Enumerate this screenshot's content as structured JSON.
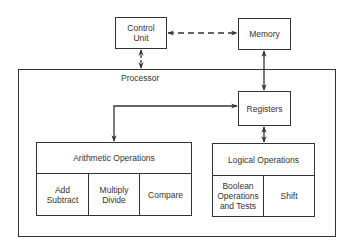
{
  "diagram": {
    "control_unit": {
      "label": "Control\nUnit",
      "line1": "Control",
      "line2": "Unit"
    },
    "memory": {
      "label": "Memory"
    },
    "processor": {
      "label": "Processor"
    },
    "registers": {
      "label": "Registers"
    },
    "arithmetic": {
      "title": "Arithmetic Operations",
      "cells": [
        {
          "line1": "Add",
          "line2": "Subtract"
        },
        {
          "line1": "Multiply",
          "line2": "Divide"
        },
        {
          "line1": "Compare"
        }
      ]
    },
    "logical": {
      "title": "Logical Operations",
      "cells": [
        {
          "line1": "Boolean",
          "line2": "Operations",
          "line3": "and Tests"
        },
        {
          "line1": "Shift"
        }
      ]
    },
    "connections": [
      {
        "from": "Control Unit",
        "to": "Memory",
        "style": "dashed",
        "direction": "bidirectional"
      },
      {
        "from": "Control Unit",
        "to": "Processor",
        "style": "dashed",
        "direction": "bidirectional"
      },
      {
        "from": "Memory",
        "to": "Registers",
        "style": "solid",
        "direction": "bidirectional"
      },
      {
        "from": "Registers",
        "to": "Arithmetic Operations",
        "style": "solid",
        "direction": "bidirectional"
      },
      {
        "from": "Registers",
        "to": "Logical Operations",
        "style": "solid",
        "direction": "bidirectional"
      }
    ]
  }
}
